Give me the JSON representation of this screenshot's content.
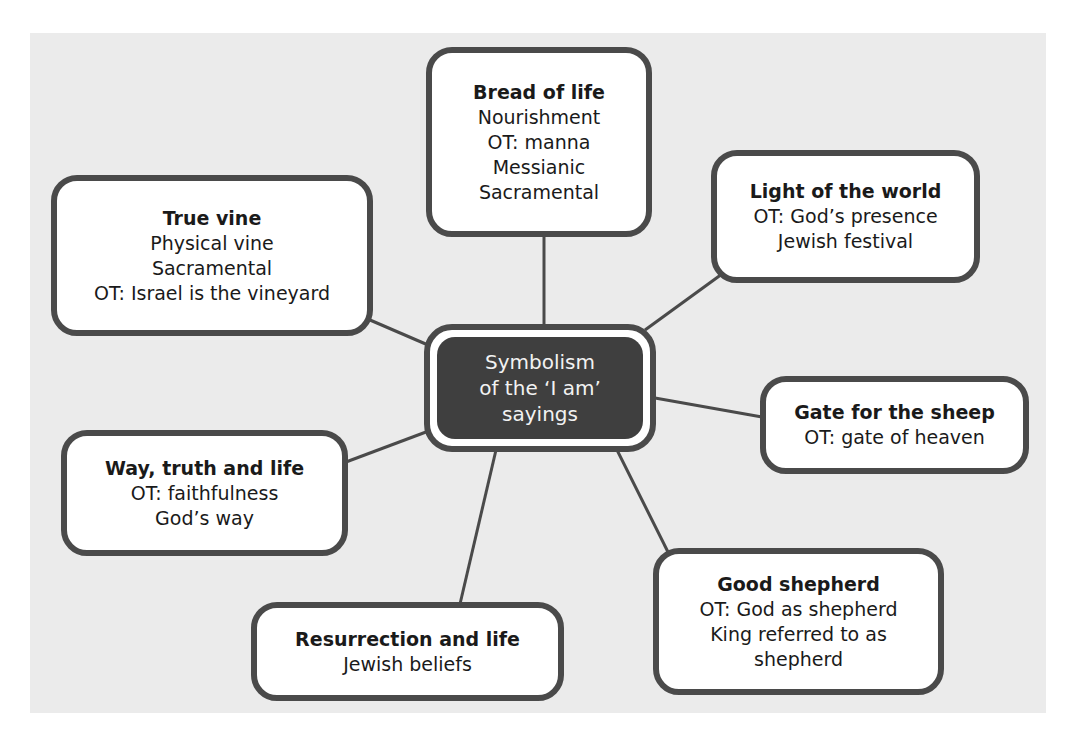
{
  "colors": {
    "background_panel": "#ebebeb",
    "box_border": "#4a4a4a",
    "box_fill": "#ffffff",
    "center_fill": "#3f3f3f",
    "center_text": "#f2f2f2",
    "text": "#1a1a1a"
  },
  "center": {
    "lines": [
      "Symbolism",
      "of the ‘I am’",
      "sayings"
    ]
  },
  "nodes": {
    "bread": {
      "title": "Bread of life",
      "lines": [
        "Nourishment",
        "OT: manna",
        "Messianic",
        "Sacramental"
      ]
    },
    "vine": {
      "title": "True vine",
      "lines": [
        "Physical vine",
        "Sacramental",
        "OT: Israel is the vineyard"
      ]
    },
    "light": {
      "title": "Light of the world",
      "lines": [
        "OT: God’s presence",
        "Jewish festival"
      ]
    },
    "gate": {
      "title": "Gate for the sheep",
      "lines": [
        "OT: gate of heaven"
      ]
    },
    "way": {
      "title": "Way, truth and life",
      "lines": [
        "OT: faithfulness",
        "God’s way"
      ]
    },
    "resurrection": {
      "title": "Resurrection and life",
      "lines": [
        "Jewish beliefs"
      ]
    },
    "shepherd": {
      "title": "Good shepherd",
      "lines": [
        "OT: God as shepherd",
        "King referred to as",
        "shepherd"
      ]
    }
  }
}
